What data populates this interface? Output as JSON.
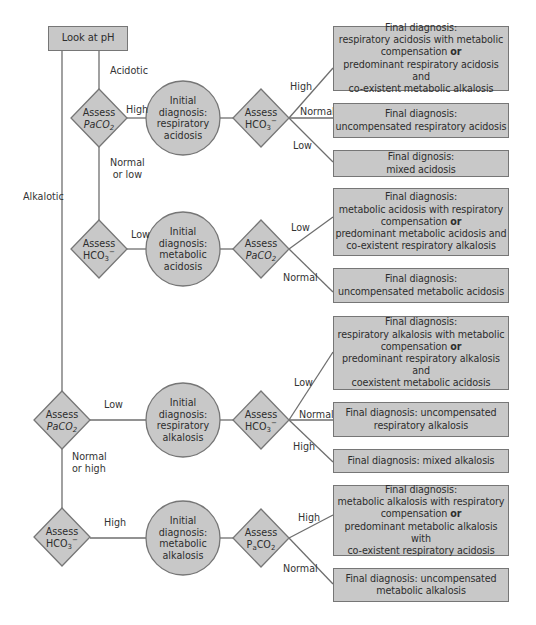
{
  "start": {
    "label": "Look at pH"
  },
  "branches": {
    "acidotic": "Acidotic",
    "alkalotic": "Alkalotic",
    "normal_or_low": [
      "Normal",
      "or low"
    ],
    "normal_or_high": [
      "Normal",
      "or high"
    ]
  },
  "assess_nodes": {
    "acid_paco2": {
      "line1": "Assess",
      "line2_main": "PaCO",
      "line2_sub": "2"
    },
    "acid_hco3": {
      "line1": "Assess",
      "line2_main": "HCO",
      "line2_sub": "3",
      "line2_sup": "−"
    },
    "resp_acid_hco3": {
      "line1": "Assess",
      "line2_main": "HCO",
      "line2_sub": "3",
      "line2_sup": "−"
    },
    "met_acid_paco2": {
      "line1": "Assess",
      "line2_main": "PaCO",
      "line2_sub": "2"
    },
    "alk_paco2": {
      "line1": "Assess",
      "line2_main": "PaCO",
      "line2_sub": "2"
    },
    "alk_hco3": {
      "line1": "Assess",
      "line2_main": "HCO",
      "line2_sub": "3",
      "line2_sup": "−"
    },
    "resp_alk_hco3": {
      "line1": "Assess",
      "line2_main": "HCO",
      "line2_sub": "3",
      "line2_sup": "−"
    },
    "met_alk_paco2": {
      "line1": "Assess",
      "line2_main": "P",
      "line2_sub_a": "a",
      "line2_main2": "CO",
      "line2_sub": "2"
    }
  },
  "initial_diagnoses": [
    {
      "lines": [
        "Initial",
        "diagnosis:",
        "respiratory",
        "acidosis"
      ]
    },
    {
      "lines": [
        "Initial",
        "diagnosis:",
        "metabolic",
        "acidosis"
      ]
    },
    {
      "lines": [
        "Initial",
        "diagnosis:",
        "respiratory",
        "alkalosis"
      ]
    },
    {
      "lines": [
        "Initial",
        "diagnosis:",
        "metabolic",
        "alkalosis"
      ]
    }
  ],
  "edge_labels": {
    "acid_paco2_high": "High",
    "acid_hco3_low": "Low",
    "alk_paco2_low": "Low",
    "alk_hco3_high": "High",
    "ra_high": "High",
    "ra_normal": "Normal",
    "ra_low": "Low",
    "ma_low": "Low",
    "ma_normal": "Normal",
    "ral_low": "Low",
    "ral_normal": "Normal",
    "ral_high": "High",
    "mal_high": "High",
    "mal_normal": "Normal"
  },
  "final_diagnoses": [
    {
      "lines": [
        "Final diagnosis:",
        "respiratory acidosis with metabolic"
      ],
      "bold_line_pre": "compensation ",
      "bold": "or",
      "lines_after": [
        "predominant respiratory acidosis and",
        "co-existent metabolic alkalosis"
      ]
    },
    {
      "lines": [
        "Final diagnosis:",
        "uncompensated respiratory acidosis"
      ]
    },
    {
      "lines": [
        "Final dignosis:",
        "mixed acidosis"
      ]
    },
    {
      "lines": [
        "Final diagnosis:",
        "metabolic acidosis with respiratory"
      ],
      "bold_line_pre": "compensation ",
      "bold": "or",
      "lines_after": [
        "predominant metabolic acidosis and",
        "co-existent respiratory alkalosis"
      ]
    },
    {
      "lines": [
        "Final diagnosis:",
        "uncompensated metabolic acidosis"
      ]
    },
    {
      "lines": [
        "Final diagnosis:",
        "respiratory alkalosis with metabolic"
      ],
      "bold_line_pre": "compensation ",
      "bold": "or",
      "lines_after": [
        "predominant respiratory alkalosis and",
        "coexistent metabolic acidosis"
      ]
    },
    {
      "lines": [
        "Final diagnosis: uncompensated",
        "respiratory alkalosis"
      ]
    },
    {
      "lines": [
        "Final diagnosis: mixed alkalosis"
      ]
    },
    {
      "lines": [
        "Final diagnosis:",
        "metabolic alkalosis with respiratory"
      ],
      "bold_line_pre": "compensation ",
      "bold": "or",
      "lines_after": [
        "predominant metabolic alkalosis with",
        "co-existent respiratory acidosis"
      ]
    },
    {
      "lines": [
        "Final diagnosis: uncompensated",
        "metabolic alkalosis"
      ]
    }
  ],
  "colors": {
    "shape_fill": "#c8c8c8",
    "shape_stroke": "#767676",
    "line": "#6e6e6e"
  }
}
